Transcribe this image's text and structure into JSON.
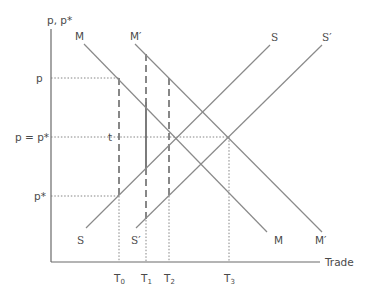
{
  "diagram": {
    "y_axis_label": "p, p*",
    "x_axis_label": "Trade",
    "price_labels": {
      "p": "p",
      "p_eq": "p = p*",
      "p_star": "p*"
    },
    "tariff_label": "t",
    "curves": {
      "M": "M",
      "M_prime": "M′",
      "S": "S",
      "S_prime": "S′"
    },
    "ticks": [
      {
        "base": "T",
        "sub": "0"
      },
      {
        "base": "T",
        "sub": "1"
      },
      {
        "base": "T",
        "sub": "2"
      },
      {
        "base": "T",
        "sub": "3"
      }
    ],
    "colors": {
      "line": "#8a8a8a",
      "axis": "#6a6a6a",
      "text": "#4a4a4a",
      "dash": "#555555"
    }
  }
}
